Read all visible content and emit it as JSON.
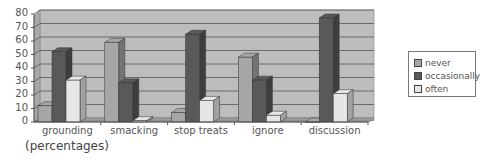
{
  "chart_data": {
    "type": "bar",
    "title": "",
    "xlabel": "",
    "ylabel": "",
    "caption": "(percentages)",
    "categories": [
      "grounding",
      "smacking",
      "stop treats",
      "ignore",
      "discussion"
    ],
    "series": [
      {
        "name": "never",
        "color": "#a6a6a6",
        "values": [
          12,
          59,
          7,
          48,
          0
        ]
      },
      {
        "name": "occasionally",
        "color": "#595959",
        "values": [
          52,
          29,
          65,
          31,
          77
        ]
      },
      {
        "name": "often",
        "color": "#e6e6e6",
        "values": [
          31,
          1,
          16,
          5,
          21
        ]
      }
    ],
    "yticks": [
      0,
      10,
      20,
      30,
      40,
      50,
      60,
      70,
      80
    ],
    "ylim": [
      0,
      80
    ],
    "grid": true,
    "legend_position": "right",
    "style": "3d-bar"
  },
  "legend": {
    "items": [
      {
        "label": "never",
        "color": "#a6a6a6"
      },
      {
        "label": "occasionally",
        "color": "#595959"
      },
      {
        "label": "often",
        "color": "#e6e6e6"
      }
    ]
  }
}
